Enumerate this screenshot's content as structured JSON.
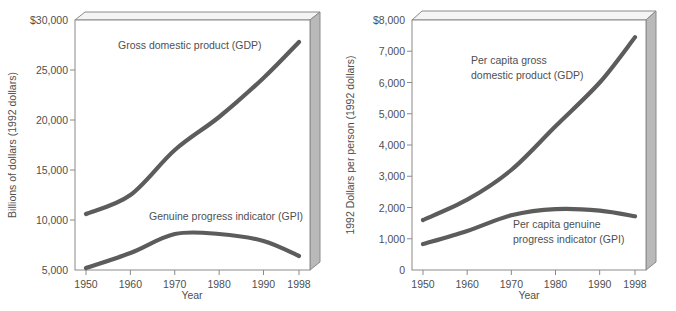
{
  "figure": {
    "background_color": "#ffffff",
    "line_color": "#5c5c5c",
    "text_color": "#4f4f4f",
    "frame_color": "#8a8a8a",
    "side_face_color": "#b9b9b9",
    "top_face_color": "#f4f4f4"
  },
  "chart_data": [
    {
      "type": "line",
      "id": "left",
      "title": "",
      "xlabel": "Year",
      "ylabel": "Billions of dollars (1992 dollars)",
      "x": [
        1950,
        1960,
        1970,
        1980,
        1990,
        1998
      ],
      "categories": [
        "1950",
        "1960",
        "1970",
        "1980",
        "1990",
        "1998"
      ],
      "xtick_labels": [
        "1950",
        "1960",
        "1970",
        "1980",
        "1990",
        "1998"
      ],
      "ytick_labels": [
        "$30,000",
        "25,000",
        "20,000",
        "15,000",
        "10,000",
        "5,000"
      ],
      "ytick_values": [
        30000,
        25000,
        20000,
        15000,
        10000,
        5000
      ],
      "ylim": [
        5000,
        30000
      ],
      "xlim": [
        1950,
        1998
      ],
      "grid": false,
      "legend": "annotations",
      "series": [
        {
          "name": "Gross domestic product (GDP)",
          "annotation": "Gross domestic product (GDP)",
          "annotation_lines": [
            "Gross domestic product (GDP)"
          ],
          "values": [
            10600,
            12500,
            17000,
            20300,
            24200,
            27800
          ]
        },
        {
          "name": "Genuine progress indicator (GPI)",
          "annotation": "Genuine progress indicator (GPI)",
          "annotation_lines": [
            "Genuine progress indicator (GPI)"
          ],
          "values": [
            5200,
            6700,
            8600,
            8600,
            7900,
            6400
          ]
        }
      ]
    },
    {
      "type": "line",
      "id": "right",
      "title": "",
      "xlabel": "Year",
      "ylabel": "1992 Dollars per person (1992 dollars)",
      "x": [
        1950,
        1960,
        1970,
        1980,
        1990,
        1998
      ],
      "categories": [
        "1950",
        "1960",
        "1970",
        "1980",
        "1990",
        "1998"
      ],
      "xtick_labels": [
        "1950",
        "1960",
        "1970",
        "1980",
        "1990",
        "1998"
      ],
      "ytick_labels": [
        "$8,000",
        "7,000",
        "6,000",
        "5,000",
        "4,000",
        "3,000",
        "2,000",
        "1,000",
        "0"
      ],
      "ytick_values": [
        8000,
        7000,
        6000,
        5000,
        4000,
        3000,
        2000,
        1000,
        0
      ],
      "ylim": [
        0,
        8000
      ],
      "xlim": [
        1950,
        1998
      ],
      "grid": false,
      "legend": "annotations",
      "series": [
        {
          "name": "Per capita gross domestic product (GDP)",
          "annotation": "Per capita gross domestic product (GDP)",
          "annotation_lines": [
            "Per capita gross",
            "domestic product (GDP)"
          ],
          "values": [
            1600,
            2250,
            3200,
            4600,
            6000,
            7450
          ]
        },
        {
          "name": "Per capita genuine progress indicator (GPI)",
          "annotation": "Per capita genuine progress indicator (GPI)",
          "annotation_lines": [
            "Per capita genuine",
            "progress indicator (GPI)"
          ],
          "values": [
            830,
            1250,
            1750,
            1950,
            1900,
            1720
          ]
        }
      ]
    }
  ]
}
